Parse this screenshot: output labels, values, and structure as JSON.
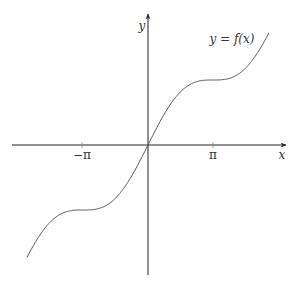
{
  "chart_data": {
    "type": "line",
    "title": "",
    "xlabel": "x",
    "ylabel": "y",
    "curve_label": "y = f(x)",
    "function": "x + sin(x)",
    "x_ticks": [
      {
        "value": -3.14159,
        "label": "−π"
      },
      {
        "value": 3.14159,
        "label": "π"
      }
    ],
    "xlim": [
      -6.0,
      6.0
    ],
    "ylim": [
      -6.0,
      6.0
    ],
    "grid": false,
    "legend": "none",
    "series": [
      {
        "name": "y = f(x)",
        "x_range": [
          -5.85,
          5.85
        ]
      }
    ],
    "colors": {
      "axis": "#222222",
      "curve": "#555555"
    }
  }
}
